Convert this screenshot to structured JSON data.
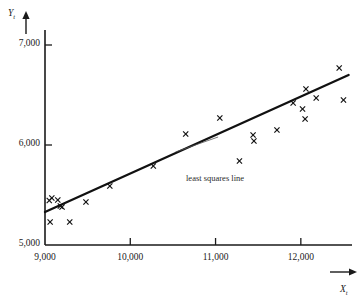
{
  "chart_data": {
    "type": "scatter",
    "title": "",
    "xlabel": "X_t",
    "ylabel": "Y_t",
    "xlim": [
      9000,
      12600
    ],
    "ylim": [
      5000,
      7150
    ],
    "xticks": [
      9000,
      10000,
      11000,
      12000
    ],
    "xticklabels": [
      "9,000",
      "10,000",
      "11,000",
      "12,000"
    ],
    "yticks": [
      5000,
      6000,
      7000
    ],
    "yticklabels": [
      "5,000",
      "6,000",
      "7,000"
    ],
    "grid": false,
    "legend": "none",
    "marker": "x",
    "points": [
      {
        "x": 9050,
        "y": 5445
      },
      {
        "x": 9080,
        "y": 5470
      },
      {
        "x": 9060,
        "y": 5230
      },
      {
        "x": 9150,
        "y": 5450
      },
      {
        "x": 9180,
        "y": 5390
      },
      {
        "x": 9200,
        "y": 5380
      },
      {
        "x": 9290,
        "y": 5230
      },
      {
        "x": 9480,
        "y": 5430
      },
      {
        "x": 9760,
        "y": 5590
      },
      {
        "x": 10270,
        "y": 5790
      },
      {
        "x": 10650,
        "y": 6110
      },
      {
        "x": 11050,
        "y": 6270
      },
      {
        "x": 11280,
        "y": 5840
      },
      {
        "x": 11440,
        "y": 6100
      },
      {
        "x": 11450,
        "y": 6040
      },
      {
        "x": 11720,
        "y": 6150
      },
      {
        "x": 11910,
        "y": 6420
      },
      {
        "x": 12020,
        "y": 6360
      },
      {
        "x": 12050,
        "y": 6260
      },
      {
        "x": 12060,
        "y": 6560
      },
      {
        "x": 12180,
        "y": 6470
      },
      {
        "x": 12450,
        "y": 6770
      },
      {
        "x": 12500,
        "y": 6450
      }
    ],
    "fit_line": {
      "label": "least squares line",
      "x_start": 9000,
      "y_start": 5330,
      "x_end": 12560,
      "y_end": 6700
    },
    "annotation": {
      "text": "least squares line",
      "leader_from_x": 11030,
      "leader_from_y": 6080,
      "leader_to_x": 10530,
      "leader_to_y": 5930
    }
  },
  "axes": {
    "y_axis_label": "Y",
    "y_axis_sub": "t",
    "x_axis_label": "X",
    "x_axis_sub": "t"
  },
  "annotations": {
    "least_squares_line": "least squares line"
  },
  "top_caption": ""
}
